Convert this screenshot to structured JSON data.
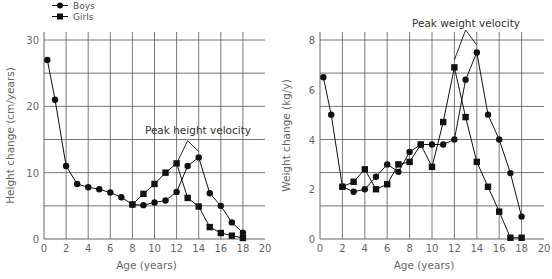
{
  "legend": {
    "items": [
      {
        "label": "Boys",
        "marker": "circle"
      },
      {
        "label": "Girls",
        "marker": "square"
      }
    ]
  },
  "colors": {
    "grid": "#555555",
    "line": "#111111",
    "text": "#666666"
  },
  "chart_data": [
    {
      "type": "line",
      "title": "",
      "xlabel": "Age (years)",
      "ylabel": "Height change (cm/years)",
      "xlim": [
        0,
        20
      ],
      "ylim": [
        0,
        30
      ],
      "x_ticks": [
        0,
        2,
        4,
        6,
        8,
        10,
        12,
        14,
        16,
        18,
        20
      ],
      "y_ticks": [
        0,
        10,
        20,
        30
      ],
      "y_gridlines": [
        5,
        10,
        15,
        20,
        25,
        30
      ],
      "x_gridlines": [
        2,
        4,
        6,
        8,
        10,
        12,
        14,
        16,
        18
      ],
      "grid": true,
      "legend_position": "top-left",
      "annotation": {
        "text": "Peak height velocity",
        "pointer": [
          [
            12,
            11.4
          ],
          [
            13,
            14.8
          ],
          [
            14,
            13.2
          ]
        ]
      },
      "series": [
        {
          "name": "Boys",
          "marker": "circle",
          "x": [
            0.3,
            1,
            2,
            3,
            4,
            5,
            6,
            7,
            8,
            9,
            10,
            11,
            12,
            13,
            14,
            15,
            16,
            17,
            18
          ],
          "values": [
            27,
            21,
            11,
            8.3,
            7.8,
            7.5,
            7.0,
            6.3,
            5.2,
            5.1,
            5.5,
            5.8,
            7.1,
            11.0,
            12.3,
            6.9,
            5.0,
            2.5,
            0.95
          ]
        },
        {
          "name": "Girls",
          "marker": "square",
          "x": [
            8,
            9,
            10,
            11,
            12,
            13,
            14,
            15,
            16,
            17,
            18
          ],
          "values": [
            5.2,
            6.8,
            8.3,
            10.0,
            11.4,
            6.2,
            4.9,
            1.8,
            0.9,
            0.5,
            0.15
          ]
        }
      ]
    },
    {
      "type": "line",
      "title": "",
      "xlabel": "Age (years)",
      "ylabel": "Weight change (kg/y)",
      "xlim": [
        0,
        20
      ],
      "ylim": [
        0,
        8
      ],
      "x_ticks": [
        0,
        2,
        4,
        6,
        8,
        10,
        12,
        14,
        16,
        18,
        20
      ],
      "y_ticks": [
        0,
        2,
        4,
        6,
        8
      ],
      "y_gridlines": [
        1.33,
        2.67,
        4.0,
        5.33,
        6.67,
        8.0
      ],
      "x_gridlines": [
        2,
        4,
        6,
        8,
        10,
        12,
        14,
        16,
        18
      ],
      "grid": true,
      "annotation": {
        "text": "Peak weight velocity",
        "pointer": [
          [
            12,
            7.2
          ],
          [
            13,
            8.4
          ],
          [
            14,
            7.8
          ]
        ]
      },
      "series": [
        {
          "name": "Boys",
          "marker": "circle",
          "x": [
            0.3,
            1,
            2,
            3,
            4,
            5,
            6,
            7,
            8,
            9,
            10,
            11,
            12,
            13,
            14,
            15,
            16,
            17,
            18
          ],
          "values": [
            6.5,
            5.0,
            2.1,
            1.9,
            2.0,
            2.5,
            3.0,
            2.7,
            3.5,
            3.8,
            3.8,
            3.8,
            4.0,
            6.4,
            7.5,
            5.0,
            4.0,
            2.65,
            0.9
          ]
        },
        {
          "name": "Girls",
          "marker": "square",
          "x": [
            2,
            3,
            4,
            5,
            6,
            7,
            8,
            9,
            10,
            11,
            12,
            13,
            14,
            15,
            16,
            17,
            18
          ],
          "values": [
            2.1,
            2.3,
            2.8,
            2.0,
            2.2,
            3.0,
            3.1,
            3.8,
            2.9,
            4.7,
            6.9,
            4.9,
            3.1,
            2.1,
            1.1,
            0.05,
            0.05
          ]
        }
      ]
    }
  ]
}
